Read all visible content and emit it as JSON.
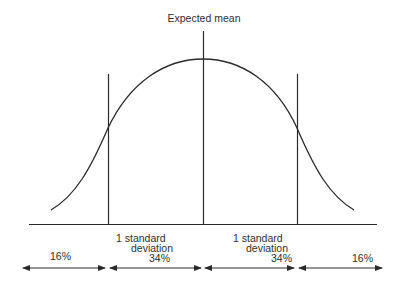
{
  "title": "Expected mean",
  "segments": [
    {
      "label": "16%",
      "region": "left-tail"
    },
    {
      "label": "1  standard",
      "label2": "deviation",
      "percent": "34%",
      "region": "left-inner"
    },
    {
      "label": "1  standard",
      "label2": "deviation",
      "percent": "34%",
      "region": "right-inner"
    },
    {
      "label": "16%",
      "region": "right-tail"
    }
  ],
  "colors": {
    "line": "#2a2a2a",
    "background": "#ffffff"
  }
}
